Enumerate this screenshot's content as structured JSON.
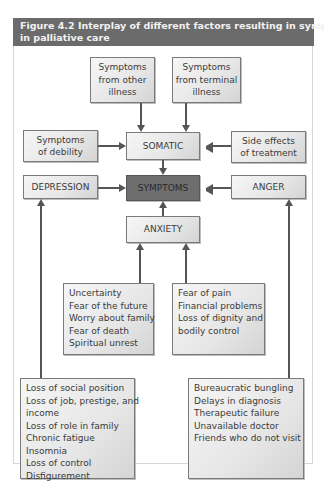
{
  "figure": {
    "title_line1": "Figure 4.2  Interplay of different factors resulting in symptoms",
    "title_line2": "in palliative care"
  },
  "nodes": {
    "other_illness": [
      "Symptoms",
      "from other",
      "illness"
    ],
    "terminal_illness": [
      "Symptoms",
      "from terminal",
      "illness"
    ],
    "debility": [
      "Symptoms",
      "of debility"
    ],
    "somatic": "SOMATIC",
    "side_effects": [
      "Side effects",
      "of treatment"
    ],
    "depression": "DEPRESSION",
    "symptoms": "SYMPTOMS",
    "anger": "ANGER",
    "anxiety": "ANXIETY",
    "anxiety_causes_left": [
      "Uncertainty",
      "Fear of the future",
      "Worry about family",
      "Fear of death",
      "Spiritual unrest"
    ],
    "anxiety_causes_right": [
      "Fear of pain",
      "Financial problems",
      "Loss of dignity and",
      "bodily control"
    ],
    "depression_causes": [
      "Loss of social position",
      "Loss of job, prestige, and",
      "income",
      "Loss of role in family",
      "Chronic fatigue",
      "Insomnia",
      "Loss of control",
      "Disfigurement"
    ],
    "anger_causes": [
      "Bureaucratic bungling",
      "Delays in diagnosis",
      "Therapeutic failure",
      "Unavailable doctor",
      "Friends who do not visit"
    ]
  },
  "colors": {
    "header_bg": "#6b6b6b",
    "symptoms_bg": "#6e6e6e",
    "box_bg": "#e6e6e6",
    "arrow": "#555555"
  }
}
